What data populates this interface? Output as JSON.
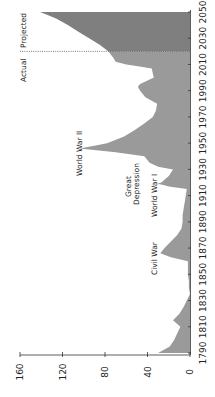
{
  "chart_data": {
    "type": "area",
    "orientation": "rotated-90-clockwise",
    "title": "",
    "xlabel": "Year",
    "ylabel": "",
    "xlim": [
      1790,
      2050
    ],
    "ylim": [
      0,
      160
    ],
    "x_ticks": [
      1790,
      1810,
      1830,
      1850,
      1870,
      1890,
      1910,
      1930,
      1950,
      1970,
      1990,
      2010,
      2030,
      2050
    ],
    "y_ticks": [
      0,
      40,
      80,
      120,
      160
    ],
    "grid": false,
    "divider_year": 2020,
    "divider_labels": {
      "left": "Actual",
      "right": "Projected"
    },
    "series": [
      {
        "name": "Actual",
        "color": "#9a9a9a",
        "x": [
          1790,
          1795,
          1800,
          1805,
          1810,
          1815,
          1820,
          1825,
          1830,
          1835,
          1840,
          1845,
          1850,
          1855,
          1860,
          1863,
          1866,
          1870,
          1875,
          1880,
          1885,
          1890,
          1895,
          1900,
          1905,
          1910,
          1915,
          1917,
          1918,
          1919,
          1920,
          1925,
          1930,
          1932,
          1935,
          1940,
          1943,
          1946,
          1948,
          1950,
          1955,
          1960,
          1965,
          1970,
          1975,
          1980,
          1985,
          1990,
          1993,
          1995,
          2000,
          2003,
          2007,
          2009,
          2010,
          2012,
          2015,
          2020
        ],
        "values": [
          30,
          19,
          15,
          12,
          9,
          16,
          10,
          6,
          3,
          0,
          1,
          1,
          2,
          2,
          2,
          18,
          28,
          24,
          18,
          12,
          8,
          7,
          7,
          6,
          5,
          4,
          3,
          20,
          25,
          31,
          27,
          20,
          16,
          30,
          38,
          43,
          70,
          104,
          90,
          78,
          62,
          52,
          43,
          35,
          32,
          31,
          42,
          47,
          49,
          47,
          34,
          35,
          36,
          52,
          60,
          70,
          72,
          77
        ]
      },
      {
        "name": "Projected",
        "color": "#7f7f7f",
        "x": [
          2020,
          2025,
          2030,
          2035,
          2040,
          2045,
          2050
        ],
        "values": [
          77,
          85,
          95,
          105,
          115,
          126,
          141
        ]
      }
    ],
    "annotations": [
      {
        "text": "Civil War",
        "year": 1866
      },
      {
        "text": "World War I",
        "year": 1919
      },
      {
        "text": "Great Depression",
        "year": 1935
      },
      {
        "text": "World War II",
        "year": 1946
      }
    ]
  },
  "labels": {
    "actual": "Actual",
    "projected": "Projected",
    "civil_war": "Civil War",
    "ww1": "World War I",
    "great": "Great",
    "depression": "Depression",
    "ww2": "World War II"
  }
}
